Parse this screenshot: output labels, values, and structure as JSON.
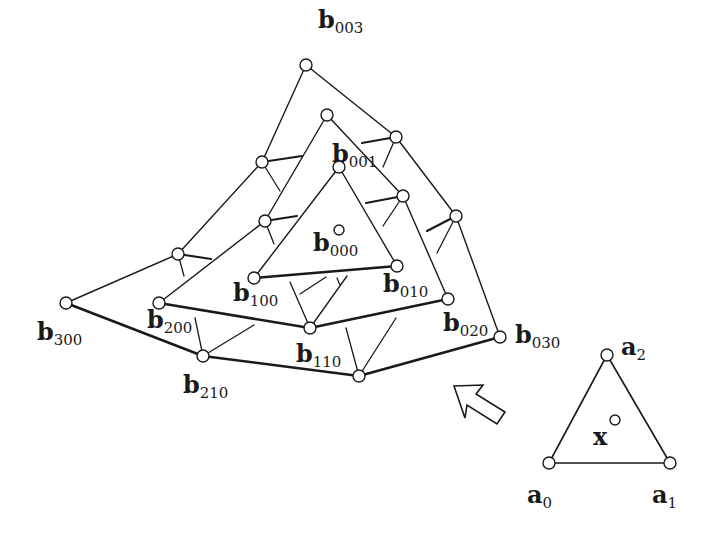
{
  "diagram": {
    "title": "",
    "colors": {
      "stroke": "#1a1a1a",
      "node_fill": "#ffffff",
      "background": "#ffffff"
    },
    "pyramid_nodes": [
      {
        "id": "b003",
        "x": 306,
        "y": 65,
        "label": "b",
        "sub": "003",
        "lx": 318,
        "ly": 28
      },
      {
        "id": "b102",
        "x": 262,
        "y": 162
      },
      {
        "id": "b012",
        "x": 396,
        "y": 137
      },
      {
        "id": "b201",
        "x": 178,
        "y": 254
      },
      {
        "id": "b021",
        "x": 456,
        "y": 216
      },
      {
        "id": "b300",
        "x": 66,
        "y": 303,
        "label": "b",
        "sub": "300",
        "lx": 37,
        "ly": 340
      },
      {
        "id": "b210",
        "x": 203,
        "y": 356,
        "label": "b",
        "sub": "210",
        "lx": 183,
        "ly": 393
      },
      {
        "id": "b120",
        "x": 359,
        "y": 376
      },
      {
        "id": "b030",
        "x": 500,
        "y": 337,
        "label": "b",
        "sub": "030",
        "lx": 515,
        "ly": 343
      },
      {
        "id": "b002",
        "x": 327,
        "y": 115
      },
      {
        "id": "b101",
        "x": 265,
        "y": 221
      },
      {
        "id": "b011",
        "x": 403,
        "y": 196
      },
      {
        "id": "b200",
        "x": 159,
        "y": 303,
        "label": "b",
        "sub": "200",
        "lx": 147,
        "ly": 328
      },
      {
        "id": "b110",
        "x": 310,
        "y": 328,
        "label": "b",
        "sub": "110",
        "lx": 296,
        "ly": 362
      },
      {
        "id": "b020",
        "x": 448,
        "y": 299,
        "label": "b",
        "sub": "020",
        "lx": 443,
        "ly": 331
      },
      {
        "id": "b001",
        "x": 339,
        "y": 167,
        "label": "b",
        "sub": "001",
        "lx": 332,
        "ly": 162
      },
      {
        "id": "b100",
        "x": 254,
        "y": 278,
        "label": "b",
        "sub": "100",
        "lx": 233,
        "ly": 301
      },
      {
        "id": "b010",
        "x": 397,
        "y": 266,
        "label": "b",
        "sub": "010",
        "lx": 383,
        "ly": 292
      },
      {
        "id": "b000",
        "x": 339,
        "y": 230,
        "label": "b",
        "sub": "000",
        "lx": 313,
        "ly": 251
      }
    ],
    "thin_edges": [
      [
        "b300",
        "b201"
      ],
      [
        "b201",
        "b102"
      ],
      [
        "b102",
        "b003"
      ],
      [
        "b003",
        "b012"
      ],
      [
        "b012",
        "b021"
      ],
      [
        "b021",
        "b030"
      ],
      [
        "b200",
        "b101"
      ],
      [
        "b101",
        "b002"
      ],
      [
        "b002",
        "b011"
      ],
      [
        "b011",
        "b020"
      ],
      [
        "b100",
        "b001"
      ],
      [
        "b001",
        "b010"
      ]
    ],
    "thick_edges": [
      [
        "b300",
        "b210"
      ],
      [
        "b210",
        "b120"
      ],
      [
        "b120",
        "b030"
      ],
      [
        "b200",
        "b110"
      ],
      [
        "b110",
        "b020"
      ],
      [
        "b100",
        "b010"
      ]
    ],
    "ticks": [
      {
        "x1": 262,
        "y1": 162,
        "x2": 302,
        "y2": 156,
        "w": 2.2
      },
      {
        "x1": 262,
        "y1": 162,
        "x2": 280,
        "y2": 191,
        "w": 1.3
      },
      {
        "x1": 265,
        "y1": 221,
        "x2": 297,
        "y2": 216,
        "w": 2.2
      },
      {
        "x1": 265,
        "y1": 221,
        "x2": 274,
        "y2": 244,
        "w": 1.3
      },
      {
        "x1": 178,
        "y1": 254,
        "x2": 211,
        "y2": 259,
        "w": 2.2
      },
      {
        "x1": 178,
        "y1": 254,
        "x2": 184,
        "y2": 276,
        "w": 1.3
      },
      {
        "x1": 396,
        "y1": 137,
        "x2": 362,
        "y2": 143,
        "w": 2.2
      },
      {
        "x1": 396,
        "y1": 137,
        "x2": 383,
        "y2": 167,
        "w": 1.3
      },
      {
        "x1": 403,
        "y1": 196,
        "x2": 366,
        "y2": 203,
        "w": 2.2
      },
      {
        "x1": 403,
        "y1": 196,
        "x2": 383,
        "y2": 226,
        "w": 1.3
      },
      {
        "x1": 456,
        "y1": 216,
        "x2": 427,
        "y2": 231,
        "w": 2.2
      },
      {
        "x1": 456,
        "y1": 216,
        "x2": 437,
        "y2": 253,
        "w": 1.3
      },
      {
        "x1": 310,
        "y1": 328,
        "x2": 290,
        "y2": 282,
        "w": 1.3
      },
      {
        "x1": 310,
        "y1": 328,
        "x2": 347,
        "y2": 276,
        "w": 1.3
      },
      {
        "x1": 300,
        "y1": 294,
        "x2": 326,
        "y2": 277,
        "w": 1.3
      },
      {
        "x1": 337,
        "y1": 278,
        "x2": 340,
        "y2": 285,
        "w": 1.3
      },
      {
        "x1": 203,
        "y1": 356,
        "x2": 195,
        "y2": 318,
        "w": 1.3
      },
      {
        "x1": 203,
        "y1": 356,
        "x2": 254,
        "y2": 325,
        "w": 1.3
      },
      {
        "x1": 359,
        "y1": 376,
        "x2": 346,
        "y2": 328,
        "w": 1.3
      },
      {
        "x1": 359,
        "y1": 376,
        "x2": 396,
        "y2": 318,
        "w": 1.3
      }
    ],
    "arrow": {
      "points": "454,386 483,385 476,394 505,412 497,424 467,405 465,418",
      "description": "hollow arrow pointing up-left toward pyramid"
    },
    "domain_triangle": {
      "nodes": [
        {
          "id": "a0",
          "x": 549,
          "y": 463,
          "label": "a",
          "sub": "0",
          "lx": 527,
          "ly": 503
        },
        {
          "id": "a1",
          "x": 670,
          "y": 463,
          "label": "a",
          "sub": "1",
          "lx": 652,
          "ly": 503
        },
        {
          "id": "a2",
          "x": 607,
          "y": 355,
          "label": "a",
          "sub": "2",
          "lx": 621,
          "ly": 355
        }
      ],
      "point_x": {
        "x": 615,
        "y": 420,
        "label": "x",
        "lx": 593,
        "ly": 445
      }
    }
  }
}
